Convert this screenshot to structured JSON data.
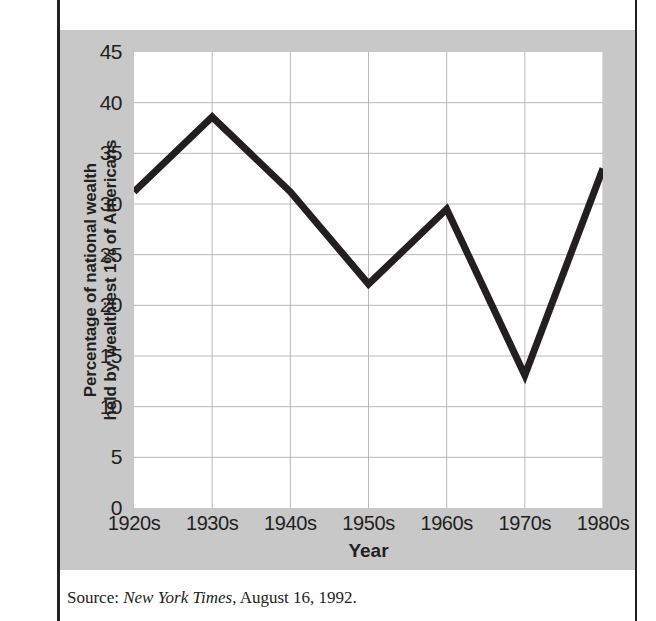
{
  "figure": {
    "caption_clipped": "est levels since the 1920s.",
    "source": {
      "label": "Source: ",
      "publication": "New York Times",
      "date": ", August 16, 1992."
    }
  },
  "colors": {
    "panel_background": "#c8c8c8",
    "plot_background": "#ffffff",
    "line_color": "#231f20",
    "grid_color": "#b9b9b9",
    "text_color": "#231f20",
    "frame_color": "#231f20"
  },
  "chart_data": {
    "type": "line",
    "title": "",
    "xlabel": "Year",
    "ylabel": "Percentage of national wealth held by wealthiest 1% of Americans",
    "ylabel_line1": "Percentage of national wealth",
    "ylabel_line2": "held by wealthiest 1% of Americans",
    "categories": [
      "1920s",
      "1930s",
      "1940s",
      "1950s",
      "1960s",
      "1970s",
      "1980s"
    ],
    "values": [
      31.2,
      38.6,
      31.2,
      22.1,
      29.5,
      13.1,
      33.5
    ],
    "ylim": [
      0,
      45
    ],
    "yticks": [
      0,
      5,
      10,
      15,
      20,
      25,
      30,
      35,
      40,
      45
    ],
    "ytick_labels": [
      "0",
      "5",
      "10",
      "15",
      "20",
      "25",
      "30",
      "35",
      "40",
      "45"
    ],
    "grid": true,
    "grid_axes": "both",
    "legend": false,
    "line_width": 7,
    "series": [
      {
        "name": "Percentage of national wealth held by wealthiest 1% of Americans",
        "values": [
          31.2,
          38.6,
          31.2,
          22.1,
          29.5,
          13.1,
          33.5
        ]
      }
    ]
  }
}
